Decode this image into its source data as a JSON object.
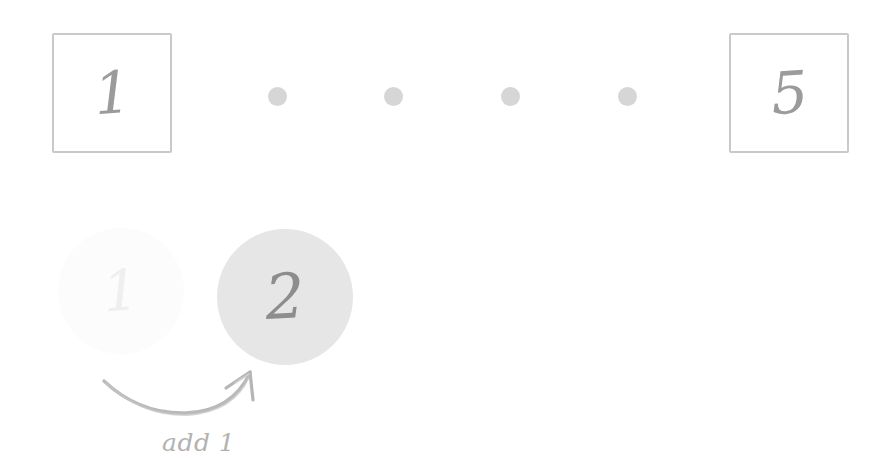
{
  "diagram": {
    "background_color": "#ffffff",
    "sequence": {
      "first_cell": {
        "value": "1",
        "icon": "boxed-number"
      },
      "ellipsis": {
        "icon": "ellipsis-dots",
        "count": 4,
        "color": "#d6d6d6"
      },
      "last_cell": {
        "value": "5",
        "icon": "boxed-number"
      },
      "box_border_color": "#c9c9c9",
      "numeral_color": "#9b9b9b"
    },
    "transition": {
      "previous_state": {
        "value": "1",
        "style": "faded",
        "fill_color": "#fafafa",
        "text_color": "#e3e3e3"
      },
      "current_state": {
        "value": "2",
        "style": "filled",
        "fill_color": "#e6e6e6",
        "text_color": "#8d8d8d"
      },
      "arrow": {
        "icon": "curved-arrow-up-right",
        "color": "#b5b5b5",
        "direction": "from-previous-to-current"
      },
      "caption": "add 1",
      "caption_color": "#b2b2b2"
    }
  }
}
